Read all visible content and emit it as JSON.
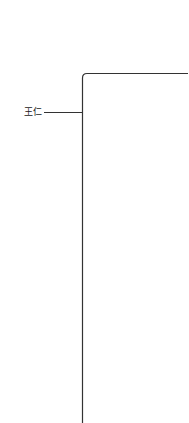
{
  "diagram": {
    "type": "tree-bracket",
    "root": {
      "label": "王仁"
    },
    "line_color": "#333333",
    "background": "#ffffff"
  }
}
